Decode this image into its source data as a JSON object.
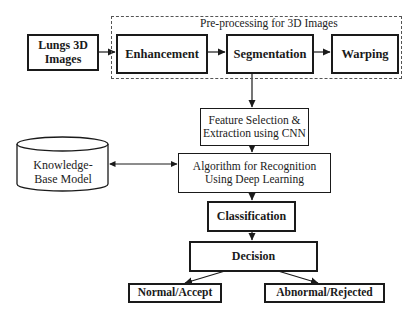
{
  "diagram": {
    "input": {
      "label": "Lungs 3D Images"
    },
    "preprocessing": {
      "group_label": "Pre-processing for 3D Images",
      "steps": [
        {
          "label": "Enhancement"
        },
        {
          "label": "Segmentation"
        },
        {
          "label": "Warping"
        }
      ]
    },
    "feature": {
      "label": "Feature Selection & Extraction using CNN"
    },
    "algorithm": {
      "label": "Algorithm for Recognition Using Deep Learning"
    },
    "knowledge_base": {
      "label": "Knowledge-Base Model",
      "shape": "cylinder"
    },
    "classification": {
      "label": "Classification"
    },
    "decision": {
      "label": "Decision"
    },
    "outcomes": [
      {
        "label": "Normal/Accept"
      },
      {
        "label": "Abnormal/Rejected"
      }
    ],
    "edges": [
      {
        "from": "Lungs 3D Images",
        "to": "Enhancement"
      },
      {
        "from": "Enhancement",
        "to": "Segmentation"
      },
      {
        "from": "Segmentation",
        "to": "Warping"
      },
      {
        "from": "Segmentation",
        "to": "Feature Selection & Extraction using CNN"
      },
      {
        "from": "Feature Selection & Extraction using CNN",
        "to": "Algorithm for Recognition Using Deep Learning"
      },
      {
        "from": "Knowledge-Base Model",
        "to": "Algorithm for Recognition Using Deep Learning",
        "bidirectional": true
      },
      {
        "from": "Algorithm for Recognition Using Deep Learning",
        "to": "Classification"
      },
      {
        "from": "Classification",
        "to": "Decision"
      },
      {
        "from": "Decision",
        "to": "Normal/Accept"
      },
      {
        "from": "Decision",
        "to": "Abnormal/Rejected"
      }
    ],
    "colors": {
      "stroke": "#1a1a1a",
      "background": "#ffffff",
      "dashed_border": "#555555"
    }
  }
}
